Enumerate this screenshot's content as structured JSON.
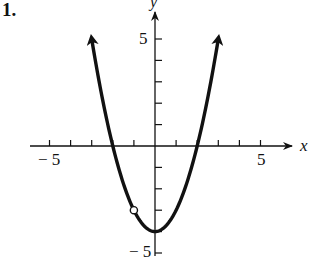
{
  "problem": {
    "number_label": "1."
  },
  "axes": {
    "x_label": "x",
    "y_label": "y",
    "x_tick_neg": "− 5",
    "x_tick_pos": "5",
    "y_tick_pos": "5",
    "y_tick_neg": "− 5"
  },
  "colors": {
    "ink": "#111111",
    "background": "#ffffff"
  },
  "chart_data": {
    "type": "line",
    "title": "",
    "xlabel": "x",
    "ylabel": "y",
    "xlim": [
      -5,
      5
    ],
    "ylim": [
      -5,
      5
    ],
    "x_ticks": [
      -5,
      -4,
      -3,
      -2,
      -1,
      1,
      2,
      3,
      4,
      5
    ],
    "y_ticks": [
      -5,
      -4,
      -3,
      -2,
      -1,
      1,
      2,
      3,
      4,
      5
    ],
    "x_tick_labels": [
      "-5",
      "5"
    ],
    "y_tick_labels": [
      "-5",
      "5"
    ],
    "grid": false,
    "series": [
      {
        "name": "y = x^2 - 4",
        "x": [
          -3,
          -2.5,
          -2,
          -1.5,
          -1,
          -0.5,
          0,
          0.5,
          1,
          1.5,
          2,
          2.5,
          3
        ],
        "values": [
          5,
          2.25,
          0,
          -1.75,
          -3,
          -3.75,
          -4,
          -3.75,
          -3,
          -1.75,
          0,
          2.25,
          5
        ],
        "arrows_at_ends": true
      }
    ],
    "annotations": [
      {
        "type": "open_circle",
        "x": -1,
        "y": -3,
        "note": "point excluded from graph"
      }
    ]
  }
}
